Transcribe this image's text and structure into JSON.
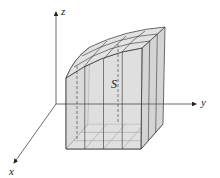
{
  "figure": {
    "axes": {
      "x_label": "x",
      "y_label": "y",
      "z_label": "z"
    },
    "surface_label": "S",
    "base_grid": {
      "rows": 3,
      "cols": 4
    },
    "colors": {
      "line": "#333333",
      "side_fill": "#d9d9d9",
      "left_fill": "#cfcfcf",
      "top_fill": "#e2e2e2",
      "base_fill": "#ececec"
    }
  }
}
